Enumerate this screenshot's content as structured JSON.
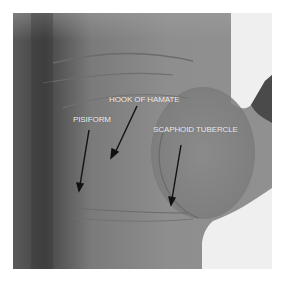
{
  "figure": {
    "labels": [
      {
        "id": "pisiform",
        "text": "PISIFORM"
      },
      {
        "id": "hook-of-hamate",
        "text": "HOOK OF HAMATE"
      },
      {
        "id": "scaphoid-tubercle",
        "text": "SCAPHOID TUBERCLE"
      }
    ],
    "colors": {
      "background": "#ffffff",
      "label_text": "#f2f2f2",
      "arrow": "#111111"
    }
  }
}
